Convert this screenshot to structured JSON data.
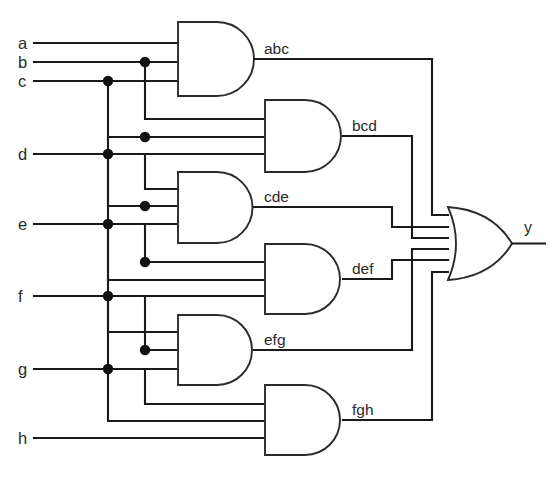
{
  "diagram": {
    "inputs": [
      {
        "name": "a",
        "label": "a",
        "y": 43
      },
      {
        "name": "b",
        "label": "b",
        "y": 62
      },
      {
        "name": "c",
        "label": "c",
        "y": 81
      },
      {
        "name": "d",
        "label": "d",
        "y": 154
      },
      {
        "name": "e",
        "label": "e",
        "y": 224
      },
      {
        "name": "f",
        "label": "f",
        "y": 296
      },
      {
        "name": "g",
        "label": "g",
        "y": 369
      },
      {
        "name": "h",
        "label": "h",
        "y": 438
      }
    ],
    "and_gates": [
      {
        "id": "abc",
        "label": "abc",
        "terms": [
          "a",
          "b",
          "c"
        ],
        "x": 178,
        "y": 22,
        "w": 78,
        "h": 74,
        "col": 1
      },
      {
        "id": "bcd",
        "label": "bcd",
        "terms": [
          "b",
          "c",
          "d"
        ],
        "x": 265,
        "y": 100,
        "w": 80,
        "h": 72,
        "col": 2
      },
      {
        "id": "cde",
        "label": "cde",
        "terms": [
          "c",
          "d",
          "e"
        ],
        "x": 178,
        "y": 172,
        "w": 78,
        "h": 71,
        "col": 1
      },
      {
        "id": "def",
        "label": "def",
        "terms": [
          "d",
          "e",
          "f"
        ],
        "x": 265,
        "y": 244,
        "w": 80,
        "h": 70,
        "col": 2
      },
      {
        "id": "efg",
        "label": "efg",
        "terms": [
          "e",
          "f",
          "g"
        ],
        "x": 178,
        "y": 315,
        "w": 78,
        "h": 70,
        "col": 1
      },
      {
        "id": "fgh",
        "label": "fgh",
        "terms": [
          "f",
          "g",
          "h"
        ],
        "x": 265,
        "y": 385,
        "w": 80,
        "h": 70,
        "col": 2
      }
    ],
    "or_gate": {
      "id": "or1",
      "output_label": "y",
      "inputs": [
        "abc",
        "bcd",
        "cde",
        "def",
        "efg",
        "fgh"
      ],
      "x": 448,
      "y": 207,
      "w": 64,
      "h": 73
    },
    "expression": "y = abc + bcd + cde + def + efg + fgh",
    "bus_columns": [
      108,
      145
    ],
    "colors": {
      "wire": "#1a1a1a",
      "gate_outline": "#2b2b2b",
      "gate_fill": "#ffffff",
      "junction": "#111111",
      "text": "#2a2a2a",
      "background": "#ffffff"
    },
    "footer_note": ""
  }
}
